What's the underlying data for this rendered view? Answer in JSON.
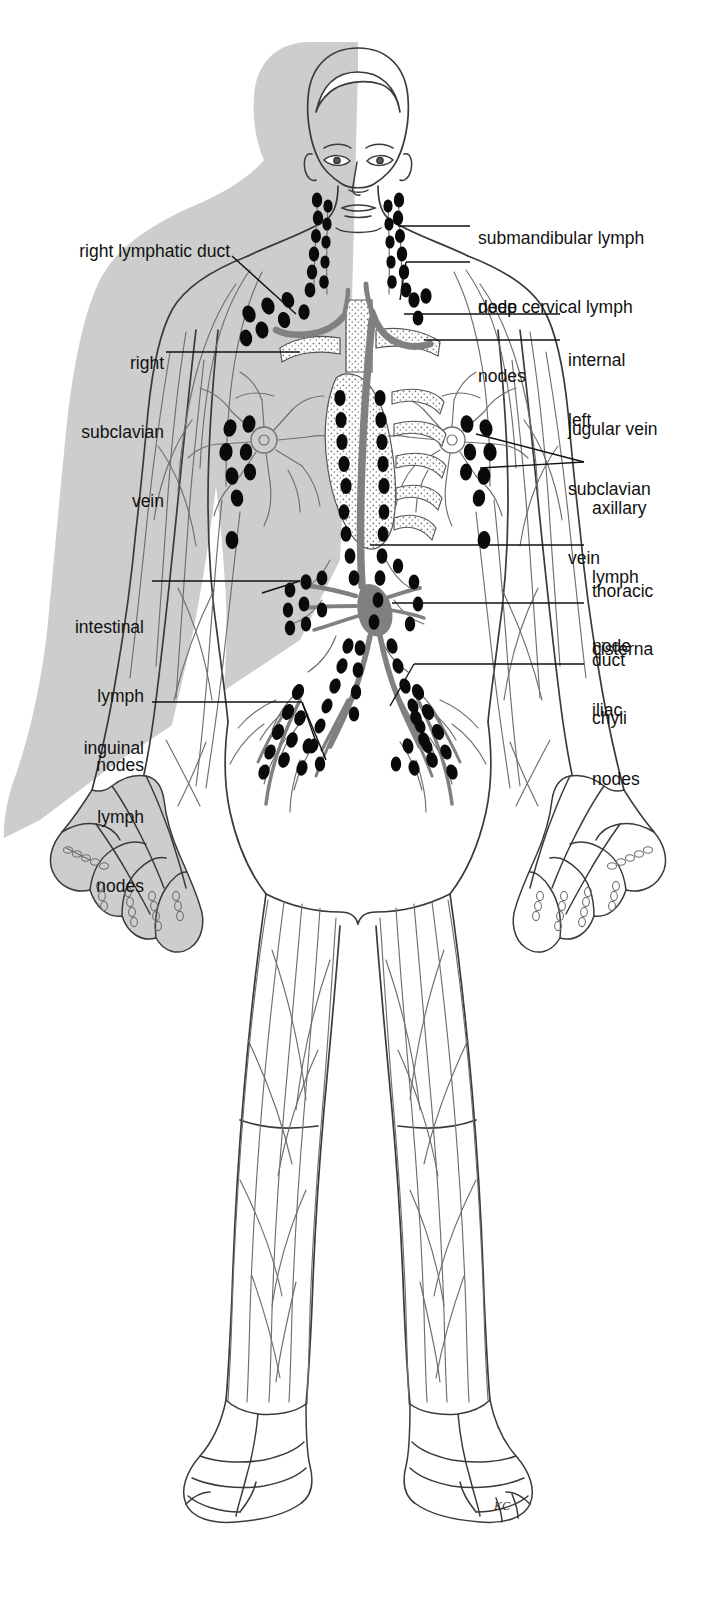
{
  "diagram": {
    "signature": "KC",
    "colors": {
      "shade_gray": "#cdcdcd",
      "vessel_gray": "#6e6e6e",
      "duct_gray": "#808080",
      "node_black": "#0a0a0a",
      "outline": "#3a3a3a",
      "leader": "#111111",
      "background": "#ffffff"
    }
  },
  "labels": {
    "left": [
      {
        "id": "right-lymphatic-duct",
        "text": "right lymphatic duct",
        "lines": [
          "right lymphatic duct"
        ]
      },
      {
        "id": "right-subclavian-vein",
        "text": "right subclavian vein",
        "lines": [
          "right",
          "subclavian",
          "vein"
        ]
      },
      {
        "id": "intestinal-lymph-nodes",
        "text": "intestinal lymph nodes",
        "lines": [
          "intestinal",
          "lymph",
          "nodes"
        ]
      },
      {
        "id": "inguinal-lymph-nodes",
        "text": "inguinal lymph nodes",
        "lines": [
          "inguinal",
          "lymph",
          "nodes"
        ]
      }
    ],
    "right": [
      {
        "id": "submandibular-lymph-node",
        "text": "submandibular lymph node",
        "lines": [
          "submandibular lymph",
          "node"
        ]
      },
      {
        "id": "deep-cervical-lymph-nodes",
        "text": "deep cervical lymph nodes",
        "lines": [
          "deep cervical lymph",
          "nodes"
        ]
      },
      {
        "id": "internal-jugular-vein",
        "text": "internal jugular vein",
        "lines": [
          "internal",
          "jugular vein"
        ]
      },
      {
        "id": "left-subclavian-vein",
        "text": "left subclavian vein",
        "lines": [
          "left",
          "subclavian",
          "vein"
        ]
      },
      {
        "id": "axillary-lymph-node",
        "text": "axillary lymph node",
        "lines": [
          "axillary",
          "lymph",
          "node"
        ]
      },
      {
        "id": "thoracic-duct",
        "text": "thoracic duct",
        "lines": [
          "thoracic",
          "duct"
        ]
      },
      {
        "id": "cisterna-chyli",
        "text": "cisterna chyli",
        "lines": [
          "cisterna",
          "chyli"
        ]
      },
      {
        "id": "iliac-nodes",
        "text": "iliac nodes",
        "lines": [
          "iliac",
          "nodes"
        ]
      }
    ]
  }
}
